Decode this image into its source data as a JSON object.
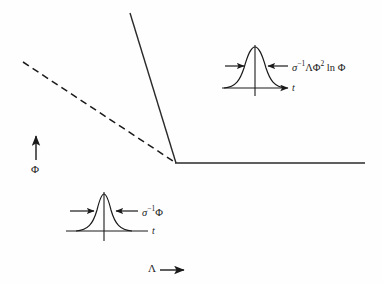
{
  "figure": {
    "background_color": "#fefefe",
    "ink_color": "#1a1a1a",
    "width": 383,
    "height": 284,
    "axes": {
      "y_label": "Φ",
      "y_arrow": "up-arrow",
      "x_label": "Λ",
      "x_arrow": "right-arrow"
    },
    "main_curve": {
      "dashed_segment": {
        "description": "dashed descending line (extrapolated asymptote)",
        "start": [
          23,
          62
        ],
        "end": [
          176,
          163
        ],
        "style": "dashed"
      },
      "steep_segment": {
        "description": "steep solid descending line",
        "start": [
          130,
          13
        ],
        "end": [
          176,
          163
        ],
        "style": "solid"
      },
      "plateau_segment": {
        "description": "horizontal solid line (plateau)",
        "start": [
          176,
          163
        ],
        "end": [
          365,
          163
        ],
        "style": "solid"
      }
    },
    "insets": [
      {
        "id": "upper-inset",
        "formula_sigma": "σ",
        "formula_exponent": "−1",
        "formula_rest": "ΛΦ",
        "formula_rest_exponent": "2",
        "formula_tail": "ln Φ",
        "formula_full": "σ−1ΛΦ2 ln Φ",
        "axis_label": "t",
        "peak_shape": "gaussian",
        "width_class": "wide"
      },
      {
        "id": "lower-inset",
        "formula_sigma": "σ",
        "formula_exponent": "−1",
        "formula_rest": "Φ",
        "formula_rest_exponent": "",
        "formula_tail": "",
        "formula_full": "σ−1Φ",
        "axis_label": "t",
        "peak_shape": "gaussian",
        "width_class": "narrow"
      }
    ]
  }
}
